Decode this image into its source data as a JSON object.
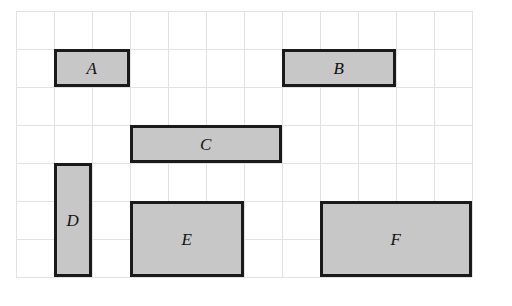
{
  "figure": {
    "canvas": {
      "width": 512,
      "height": 306,
      "background_color": "#ffffff"
    },
    "grid": {
      "origin_x": 16,
      "origin_y": 11,
      "cell_size": 38,
      "columns": 12,
      "rows": 7,
      "line_color": "#e2e2e2",
      "line_width": 1
    },
    "style": {
      "rect_fill_color": "#c7c7c7",
      "rect_border_color": "#1a1a1a",
      "rect_border_width": 3,
      "label_color": "#111111",
      "label_style": "italic"
    },
    "rectangles": [
      {
        "label": "A",
        "col": 1,
        "row": 1,
        "cols_wide": 2,
        "rows_tall": 1,
        "x": 54,
        "y": 49,
        "width": 76,
        "height": 38,
        "area_cells": 2
      },
      {
        "label": "B",
        "col": 7,
        "row": 1,
        "cols_wide": 3,
        "rows_tall": 1,
        "x": 282,
        "y": 49,
        "width": 114,
        "height": 38,
        "area_cells": 3
      },
      {
        "label": "C",
        "col": 3,
        "row": 3,
        "cols_wide": 4,
        "rows_tall": 1,
        "x": 130,
        "y": 125,
        "width": 152,
        "height": 38,
        "area_cells": 4
      },
      {
        "label": "D",
        "col": 1,
        "row": 4,
        "cols_wide": 1,
        "rows_tall": 3,
        "x": 54,
        "y": 163,
        "width": 38,
        "height": 114,
        "area_cells": 3
      },
      {
        "label": "E",
        "col": 3,
        "row": 5,
        "cols_wide": 3,
        "rows_tall": 2,
        "x": 130,
        "y": 201,
        "width": 114,
        "height": 76,
        "area_cells": 6
      },
      {
        "label": "F",
        "col": 8,
        "row": 5,
        "cols_wide": 4,
        "rows_tall": 2,
        "x": 320,
        "y": 201,
        "width": 152,
        "height": 76,
        "area_cells": 8
      }
    ]
  }
}
